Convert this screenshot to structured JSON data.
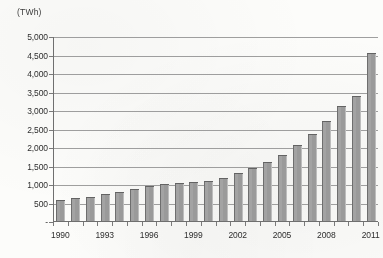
{
  "chart_data": {
    "type": "bar",
    "title": "",
    "subtitle": "",
    "unit_label": "(TWh)",
    "xlabel": "",
    "ylabel": "(TWh)",
    "ylim": [
      0,
      5000
    ],
    "ytick_step": 500,
    "grid": true,
    "legend": "none",
    "bar_color": "#9a9a9a",
    "categories": [
      "1990",
      "1991",
      "1992",
      "1993",
      "1994",
      "1995",
      "1996",
      "1997",
      "1998",
      "1999",
      "2000",
      "2001",
      "2002",
      "2003",
      "2004",
      "2005",
      "2006",
      "2007",
      "2008",
      "2009",
      "2010",
      "2011"
    ],
    "values": [
      600,
      650,
      680,
      750,
      820,
      880,
      960,
      1020,
      1060,
      1080,
      1120,
      1200,
      1320,
      1450,
      1620,
      1800,
      2080,
      2380,
      2720,
      3140,
      3400,
      4580
    ],
    "ytick_labels": [
      "5,000",
      "4,500",
      "4,000",
      "3,500",
      "3,000",
      "2,500",
      "2,000",
      "1,500",
      "1,000",
      "500",
      "-"
    ],
    "ytick_values": [
      5000,
      4500,
      4000,
      3500,
      3000,
      2500,
      2000,
      1500,
      1000,
      500,
      0
    ],
    "xtick_labels": [
      "1990",
      "1993",
      "1996",
      "1999",
      "2002",
      "2005",
      "2008",
      "2011"
    ],
    "xtick_categories": [
      "1990",
      "1993",
      "1996",
      "1999",
      "2002",
      "2005",
      "2008",
      "2011"
    ]
  },
  "colors": {
    "bar": "#9a9a9a",
    "bar_edge_dark": "#6e6e6e",
    "bar_edge_light": "#bdbdbd",
    "gridline": "#8e8e8e",
    "axis": "#6f6f6f",
    "text": "#2e2e2e",
    "background": "#fcfcfa"
  }
}
